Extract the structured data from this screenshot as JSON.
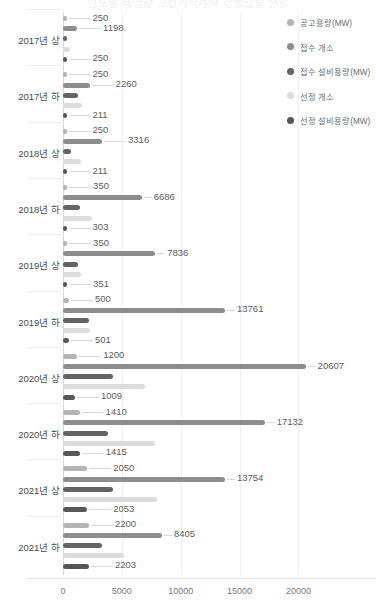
{
  "chart_data": {
    "type": "bar",
    "orientation": "horizontal",
    "title": "연도별 태양광 고정가격계약 경쟁입찰 현황",
    "xlabel": "",
    "ylabel": "",
    "xlim": [
      0,
      22000
    ],
    "xticks": [
      0,
      5000,
      10000,
      15000,
      20000
    ],
    "xtick_labels": [
      "0",
      "5000",
      "10000",
      "15000",
      "20000"
    ],
    "grid": true,
    "legend_position": "right",
    "categories": [
      "2017년 상",
      "2017년 하",
      "2018년 상",
      "2018년 하",
      "2019년 상",
      "2019년 하",
      "2020년 상",
      "2020년 하",
      "2021년 상",
      "2021년 하"
    ],
    "series": [
      {
        "name": "공고용량(MW)",
        "color": "#b4b4b4",
        "labeled": true,
        "values": [
          250,
          250,
          250,
          350,
          350,
          500,
          1200,
          1410,
          2050,
          2200
        ]
      },
      {
        "name": "접수 개소",
        "color": "#8d8d8d",
        "labeled": true,
        "values": [
          1198,
          2260,
          3316,
          6686,
          7836,
          13761,
          20607,
          17132,
          13754,
          8405
        ]
      },
      {
        "name": "접수 설비용량(MW)",
        "color": "#646464",
        "labeled": false,
        "values": [
          320,
          1250,
          700,
          1450,
          1250,
          2250,
          4250,
          3850,
          4250,
          3300
        ]
      },
      {
        "name": "선정 개소",
        "color": "#dcdcdc",
        "labeled": false,
        "values": [
          600,
          1600,
          1500,
          2500,
          1500,
          2300,
          7000,
          7800,
          8000,
          5200
        ]
      },
      {
        "name": "선정 설비용량(MW)",
        "color": "#575757",
        "labeled": true,
        "values": [
          250,
          211,
          211,
          303,
          351,
          501,
          1009,
          1415,
          2053,
          2203
        ]
      }
    ]
  },
  "legend": {
    "items": [
      {
        "label": "공고용량(MW)",
        "color": "#b4b4b4"
      },
      {
        "label": "접수 개소",
        "color": "#8d8d8d"
      },
      {
        "label": "접수 설비용량(MW)",
        "color": "#646464"
      },
      {
        "label": "선정 개소",
        "color": "#dcdcdc"
      },
      {
        "label": "선정 설비용량(MW)",
        "color": "#575757"
      }
    ]
  }
}
